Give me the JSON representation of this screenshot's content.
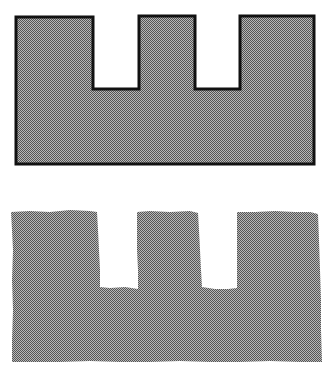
{
  "figure": {
    "background": "#ffffff",
    "fill_color": "#8e8e8e",
    "outline_color": "#111111",
    "shapes": [
      {
        "id": "outlined-crenellated-shape",
        "description": "Rectangle with two rectangular notches cut from the top edge, drawn with a solid black outline and halftone gray fill",
        "outline": true
      },
      {
        "id": "torn-crenellated-shape",
        "description": "Same notched shape torn from paper with irregular edges, halftone gray fill, no outline",
        "outline": false
      }
    ]
  }
}
